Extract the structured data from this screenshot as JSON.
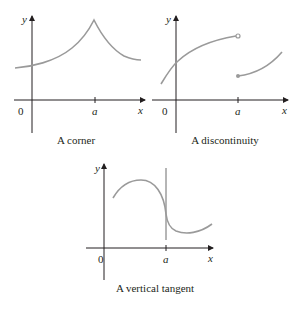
{
  "panels": [
    {
      "id": "corner",
      "caption": "A corner",
      "y_label": "y",
      "x_label": "x",
      "origin_label": "0",
      "tick_label": "a"
    },
    {
      "id": "discontinuity",
      "caption": "A discontinuity",
      "y_label": "y",
      "x_label": "x",
      "origin_label": "0",
      "tick_label": "a"
    },
    {
      "id": "vertical-tangent",
      "caption": "A vertical tangent",
      "y_label": "y",
      "x_label": "x",
      "origin_label": "0",
      "tick_label": "a"
    }
  ],
  "colors": {
    "axis": "#231f20",
    "curve": "#9a9a9a",
    "text": "#231f20"
  }
}
